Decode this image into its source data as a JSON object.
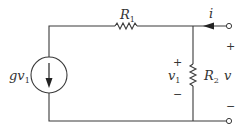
{
  "diagram": {
    "type": "circuit",
    "components": {
      "source": {
        "label": "gv",
        "subscript": "1",
        "kind": "dependent-current-source",
        "direction": "down"
      },
      "r1": {
        "label": "R",
        "subscript": "1"
      },
      "r2": {
        "label": "R",
        "subscript": "2"
      },
      "current": {
        "label": "i",
        "direction": "left"
      },
      "v1": {
        "label": "v",
        "subscript": "1",
        "plus": "+",
        "minus": "−"
      },
      "v": {
        "label": "v",
        "plus": "+",
        "minus": "−"
      }
    },
    "colors": {
      "wire": "#3a3a3a",
      "text": "#333333",
      "background": "#ffffff"
    }
  }
}
